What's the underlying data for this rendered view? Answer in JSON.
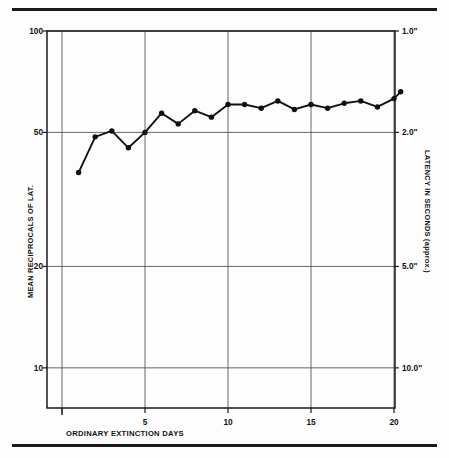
{
  "figure": {
    "rules": [
      "top-rule",
      "bottom-rule"
    ],
    "xcaption": "ORDINARY EXTINCTION DAYS",
    "ylabel_left": "MEAN RECIPROCALS OF LAT.",
    "ylabel_right": "LATENCY IN SECONDS (approx.)"
  },
  "chart_data": {
    "type": "line",
    "title": "",
    "xlabel": "ORDINARY EXTINCTION DAYS",
    "ylabel": "MEAN RECIPROCALS OF LAT.",
    "ylabel_secondary": "LATENCY IN SECONDS (approx.)",
    "yscale": "log",
    "ylim": [
      7.5,
      100
    ],
    "xlim": [
      0,
      20.6
    ],
    "grid": true,
    "legend": null,
    "marker": "filled-circle",
    "line_color": "#111111",
    "yticks": [
      100,
      50,
      20,
      10
    ],
    "ytick_labels": [
      "100",
      "50",
      "20",
      "10"
    ],
    "ytick_labels_secondary": [
      "1.0\"",
      "2.0\"",
      "5.0\"",
      "10.0\""
    ],
    "ytick_values_secondary": [
      100,
      50,
      20,
      10
    ],
    "xticks": [
      5,
      10,
      15,
      20
    ],
    "xtick_labels": [
      "5",
      "10",
      "15",
      "20"
    ],
    "x": [
      1,
      2,
      3,
      4,
      5,
      6,
      7,
      8,
      9,
      10,
      11,
      12,
      13,
      14,
      15,
      16,
      17,
      18,
      19,
      20
    ],
    "values": [
      38,
      48.5,
      50.5,
      45,
      50,
      57,
      53,
      58,
      55.5,
      60.5,
      60.5,
      59,
      62,
      58.5,
      60.5,
      59,
      61,
      62,
      59.5,
      63
    ],
    "series": [
      {
        "name": "mean reciprocal of latency",
        "values": [
          38,
          48.5,
          50.5,
          45,
          50,
          57,
          53,
          58,
          55.5,
          60.5,
          60.5,
          59,
          62,
          58.5,
          60.5,
          59,
          61,
          62,
          59.5,
          63
        ]
      }
    ],
    "extra_point": {
      "x": 20.4,
      "y": 66
    }
  }
}
